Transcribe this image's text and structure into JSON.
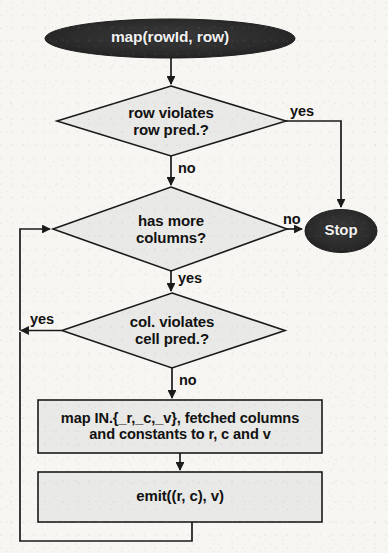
{
  "diagram": {
    "colors": {
      "page_background": "#f7f6f3",
      "node_fill": "#e9e9e7",
      "node_stroke": "#1a1a1a",
      "terminator_fill": "#2b2b2b",
      "terminator_text": "#f2f2f2",
      "connector": "#1a1a1a",
      "text": "#111111"
    },
    "nodes": [
      {
        "id": "start",
        "type": "terminator",
        "label": "map(rowId, row)",
        "shape": "ellipse"
      },
      {
        "id": "row-pred",
        "type": "decision",
        "label": "row violates\nrow pred.?",
        "shape": "diamond"
      },
      {
        "id": "has-more-columns",
        "type": "decision",
        "label": "has more\ncolumns?",
        "shape": "diamond"
      },
      {
        "id": "stop",
        "type": "terminator",
        "label": "Stop",
        "shape": "ellipse"
      },
      {
        "id": "cell-pred",
        "type": "decision",
        "label": "col. violates\ncell pred.?",
        "shape": "diamond"
      },
      {
        "id": "map-columns",
        "type": "process",
        "label": "map IN.{_r,_c,_v}, fetched columns\nand constants to r, c and v",
        "shape": "rectangle"
      },
      {
        "id": "emit",
        "type": "process",
        "label": "emit((r, c), v)",
        "shape": "rectangle"
      }
    ],
    "edges": [
      {
        "id": "start-to-row-pred",
        "from": "start",
        "to": "row-pred",
        "label": ""
      },
      {
        "id": "row-pred-yes",
        "from": "row-pred",
        "to": "stop",
        "label": "yes"
      },
      {
        "id": "row-pred-no",
        "from": "row-pred",
        "to": "has-more-columns",
        "label": "no"
      },
      {
        "id": "has-more-columns-no",
        "from": "has-more-columns",
        "to": "stop",
        "label": "no"
      },
      {
        "id": "has-more-columns-yes",
        "from": "has-more-columns",
        "to": "cell-pred",
        "label": "yes"
      },
      {
        "id": "cell-pred-yes",
        "from": "cell-pred",
        "to": "has-more-columns",
        "label": "yes"
      },
      {
        "id": "cell-pred-no",
        "from": "cell-pred",
        "to": "map-columns",
        "label": "no"
      },
      {
        "id": "map-to-emit",
        "from": "map-columns",
        "to": "emit",
        "label": ""
      },
      {
        "id": "emit-loop-back",
        "from": "emit",
        "to": "has-more-columns",
        "label": ""
      }
    ]
  }
}
